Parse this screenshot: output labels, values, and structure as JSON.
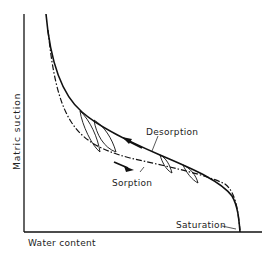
{
  "diagram": {
    "axes": {
      "x_label": "Water content",
      "y_label": "Matric suction"
    },
    "curves": [
      {
        "name": "Desorption",
        "style": "solid",
        "direction": "drying (arrow toward higher suction)"
      },
      {
        "name": "Sorption",
        "style": "dash-dot",
        "direction": "wetting (arrow toward higher water content)"
      }
    ],
    "annotations": {
      "desorption": "Desorption",
      "sorption": "Sorption",
      "saturation": "Saturation"
    },
    "colors": {
      "line": "#111111",
      "background": "#ffffff"
    }
  }
}
